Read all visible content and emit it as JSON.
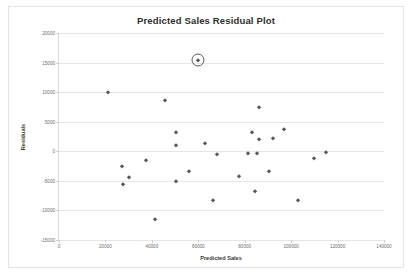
{
  "chart_data": {
    "type": "scatter",
    "title": "Predicted Sales Residual Plot",
    "xlabel": "Predicted Sales",
    "ylabel": "Residuals",
    "xlim": [
      0,
      140000
    ],
    "ylim": [
      -15000,
      20000
    ],
    "xticks": [
      0,
      20000,
      40000,
      60000,
      80000,
      100000,
      120000,
      140000
    ],
    "xtick_labels": [
      "0",
      "20000",
      "40000",
      "60000",
      "80000",
      "100000",
      "120000",
      "140000"
    ],
    "yticks": [
      -15000,
      -10000,
      -5000,
      0,
      5000,
      10000,
      15000,
      20000
    ],
    "ytick_labels": [
      "-15000",
      "-10000",
      "-5000",
      "0",
      "5000",
      "10000",
      "15000",
      "20000"
    ],
    "grid": "horizontal",
    "legend": "none",
    "marker": "diamond",
    "marker_color": "#595959",
    "points": [
      {
        "x": 21000,
        "y": 10000
      },
      {
        "x": 27000,
        "y": -2500
      },
      {
        "x": 27500,
        "y": -5500
      },
      {
        "x": 30000,
        "y": -4300
      },
      {
        "x": 37500,
        "y": -1400
      },
      {
        "x": 45500,
        "y": 8700
      },
      {
        "x": 41500,
        "y": -11500
      },
      {
        "x": 50500,
        "y": 3300
      },
      {
        "x": 50500,
        "y": 1000
      },
      {
        "x": 50500,
        "y": -5000
      },
      {
        "x": 56000,
        "y": -3400
      },
      {
        "x": 60000,
        "y": 15500
      },
      {
        "x": 63000,
        "y": 1400
      },
      {
        "x": 66500,
        "y": -8300
      },
      {
        "x": 68000,
        "y": -500
      },
      {
        "x": 77500,
        "y": -4200
      },
      {
        "x": 81500,
        "y": -300
      },
      {
        "x": 83000,
        "y": 3200
      },
      {
        "x": 85500,
        "y": -300
      },
      {
        "x": 86000,
        "y": 7500
      },
      {
        "x": 86000,
        "y": 2000
      },
      {
        "x": 84500,
        "y": -6700
      },
      {
        "x": 90500,
        "y": -3400
      },
      {
        "x": 92000,
        "y": 2300
      },
      {
        "x": 97000,
        "y": 3800
      },
      {
        "x": 103000,
        "y": -8300
      },
      {
        "x": 110000,
        "y": -1200
      },
      {
        "x": 115000,
        "y": -100
      }
    ],
    "annotation": {
      "type": "circle-highlight",
      "x": 60000,
      "y": 15500
    }
  }
}
